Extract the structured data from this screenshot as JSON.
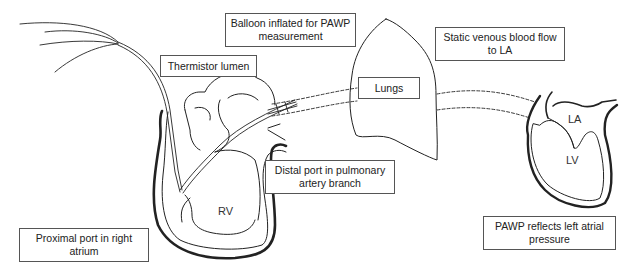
{
  "diagram": {
    "labels": {
      "balloon": "Balloon inflated for PAWP measurement",
      "thermistor": "Thermistor lumen",
      "lungs": "Lungs",
      "static_flow": "Static venous blood flow to LA",
      "distal_port": "Distal port in pulmonary artery branch",
      "proximal_port": "Proximal port in right atrium",
      "pawp_reflects": "PAWP reflects left atrial pressure"
    },
    "chambers": {
      "rv": "RV",
      "la": "LA",
      "lv": "LV"
    },
    "colors": {
      "line": "#222222",
      "box_border": "#555555",
      "background": "#ffffff"
    }
  }
}
